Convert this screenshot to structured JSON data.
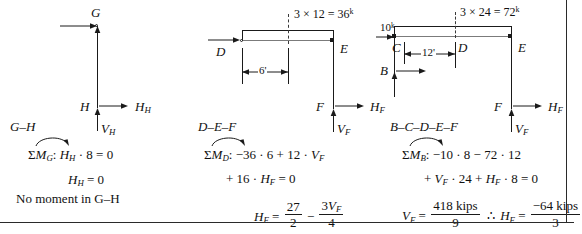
{
  "figure": {
    "type": "structural-free-body-diagrams",
    "panel_count": 3
  },
  "panels": [
    {
      "id": "G-H",
      "free_body_label": "G–H",
      "joint_labels": {
        "top": "G",
        "bottom": "H"
      },
      "force_labels": {
        "horizontal_at_h": "H",
        "horizontal_at_h_sub": "H",
        "vertical_at_h": "V",
        "vertical_at_h_sub": "H"
      },
      "equations": [
        {
          "id": "moment-sum",
          "prefix": "ΣM",
          "subscript": "G",
          "colon": ":",
          "body": "Hₕ · 8 = 0",
          "plain": "ΣM_G:  H_H · 8 = 0"
        },
        {
          "id": "result",
          "plain": "H_H = 0"
        }
      ],
      "note": "No moment in G–H"
    },
    {
      "id": "D-E-F",
      "free_body_label": "D–E–F",
      "joint_labels": {
        "left": "D",
        "right": "E",
        "bottom": "F"
      },
      "load_label": {
        "expression": "3 × 12 = 36",
        "unit_superscript": "k",
        "full": "3 × 12 = 36ᵏ"
      },
      "dimension": "6'",
      "force_labels": {
        "horizontal_at_f": "H",
        "horizontal_at_f_sub": "F",
        "vertical_at_f": "V",
        "vertical_at_f_sub": "F"
      },
      "equations": [
        {
          "id": "moment-sum",
          "prefix": "ΣM",
          "subscript": "D",
          "line1": "−36 · 6 + 12 · Vₘ",
          "line2": "+ 16 · Hₘ = 0",
          "plain": "ΣM_D: −36·6 + 12·V_F + 16·H_F = 0"
        },
        {
          "id": "result",
          "lhs": "H",
          "lhs_sub": "F",
          "eq": "=",
          "term1_num": "27",
          "term1_den": "2",
          "operator": "−",
          "term2_num": "3V",
          "term2_num_sub": "F",
          "term2_den": "4",
          "plain": "H_F = 27/2 − 3V_F/4"
        }
      ]
    },
    {
      "id": "B-C-D-E-F",
      "free_body_label": "B–C–D–E–F",
      "joint_labels": {
        "upper_left": "C",
        "lower_left": "B",
        "middle": "D",
        "right": "E",
        "bottom": "F"
      },
      "applied_load": {
        "value": "10",
        "unit_superscript": "k",
        "full": "10ᵏ"
      },
      "load_label": {
        "expression": "3 × 24 = 72",
        "unit_superscript": "k",
        "full": "3 × 24 = 72ᵏ"
      },
      "dimension": "12'",
      "force_labels": {
        "horizontal_at_f": "H",
        "horizontal_at_f_sub": "F",
        "vertical_at_f": "V",
        "vertical_at_f_sub": "F"
      },
      "equations": [
        {
          "id": "moment-sum",
          "prefix": "ΣM",
          "subscript": "B",
          "line1": "−10 · 8 − 72 · 12",
          "line2": "+ Vₘ · 24 + Hₘ · 8 = 0",
          "plain": "ΣM_B: −10·8 − 72·12 + V_F·24 + H_F·8 = 0"
        },
        {
          "id": "result",
          "lhs": "V",
          "lhs_sub": "F",
          "eq": "=",
          "term1_num": "418 kips",
          "term1_den": "9",
          "therefore": "∴",
          "rhs_lhs": "H",
          "rhs_lhs_sub": "F",
          "rhs_eq": "=",
          "term2_num": "−64 kips",
          "term2_den": "3",
          "plain": "V_F = 418 kips / 9  ∴  H_F = −64 kips / 3"
        }
      ]
    }
  ],
  "symbols": {
    "sigma": "Σ",
    "moment_arrow": "curved-moment-arrow",
    "therefore": "∴",
    "minus": "−",
    "times": "×",
    "dot": "·"
  }
}
